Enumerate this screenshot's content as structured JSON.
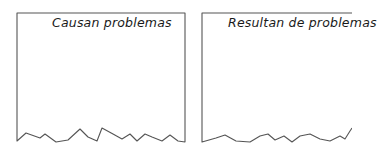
{
  "panels": [
    {
      "title": "Causan problemas"
    },
    {
      "title": "Resultan de problemas"
    }
  ],
  "colors": {
    "stroke": "#555555",
    "background": "#ffffff",
    "text": "#1a1a1a"
  }
}
